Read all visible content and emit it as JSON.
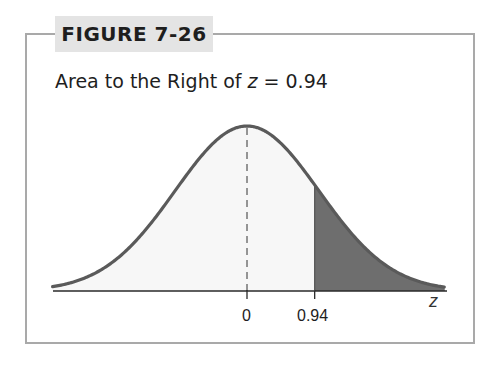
{
  "figure": {
    "label": "FIGURE 7-26",
    "title_prefix": "Area to the Right of ",
    "title_var": "z",
    "title_suffix": " = 0.94"
  },
  "chart_data": {
    "type": "area",
    "title": "Area to the Right of z = 0.94",
    "distribution": "standard normal",
    "xlabel": "z",
    "ylabel": "",
    "x_ticks": [
      0,
      0.94
    ],
    "x_tick_labels": [
      "0",
      "0.94"
    ],
    "mean": 0,
    "shaded_region": {
      "from": 0.94,
      "to": "infinity",
      "side": "right"
    },
    "dashed_line_at": 0,
    "xlim": [
      -2.7,
      2.75
    ],
    "colors": {
      "curve": "#5a5a5a",
      "shaded": "#6e6e6e",
      "unshaded_fill": "#f7f7f7",
      "frame": "#a9a9a9",
      "label_bg": "#e4e4e4"
    }
  },
  "axis": {
    "tick0": "0",
    "tick1": "0.94",
    "var": "z"
  }
}
